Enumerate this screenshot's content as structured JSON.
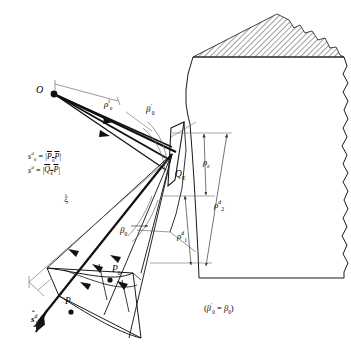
{
  "figure": {
    "kind": "utd-edge-diffraction-ray-tube-diagram",
    "labels": {
      "source_point": "O",
      "rho_e_incident": {
        "base": "ρ",
        "sub": "e",
        "sup": "i"
      },
      "beta_prime_0": {
        "base": "β",
        "prime": "′",
        "sub": "0"
      },
      "beta_0": {
        "base": "β",
        "sub": "0"
      },
      "q_e": {
        "base": "Q",
        "sub": "E"
      },
      "rho_e": {
        "base": "ρ",
        "sub": "e"
      },
      "rho_2_d": {
        "base": "ρ",
        "sub": "2",
        "sup": "d"
      },
      "rho_1_d": {
        "base": "ρ",
        "sub": "1",
        "sup": "d"
      },
      "p_0": {
        "base": "P",
        "sub": "0"
      },
      "p_point": "P",
      "s_d_diagonal": {
        "base": "s",
        "sup": "d"
      },
      "s_hat_d": {
        "base": "s",
        "sup": "d",
        "hat": "ˆ"
      },
      "equation_line_1": {
        "lhs_base": "s",
        "lhs_sub": "0",
        "lhs_sup": "d",
        "eq": "=",
        "bar_left": "|",
        "bar_right": "|",
        "inner_a": "P",
        "inner_a_sub": "0",
        "inner_b": "P"
      },
      "equation_line_2": {
        "lhs_base": "s",
        "lhs_sup": "d",
        "eq": "=",
        "bar_left": "|",
        "bar_right": "|",
        "inner_a": "Q",
        "inner_a_sub": "E",
        "inner_b": "P"
      },
      "note": {
        "open": "(",
        "left_base": "β",
        "left_prime": "′",
        "left_sub": "0",
        "eq": "=",
        "right_base": "β",
        "right_sub": "0",
        "close": ")"
      }
    },
    "colors": {
      "line": "#1a1a1a",
      "thin_line": "#6d6d6d",
      "hatch": "#2a2a2a",
      "background": "#ffffff"
    }
  }
}
